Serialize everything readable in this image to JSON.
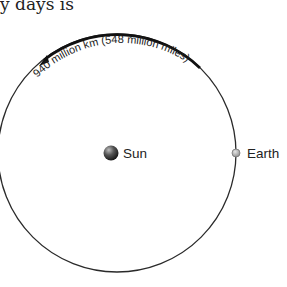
{
  "caption": "y days is",
  "diagram": {
    "distance_label": "940 million km (548 million miles)",
    "sun_label": "Sun",
    "earth_label": "Earth",
    "colors": {
      "orbit": "#2a2a2a",
      "arc": "#111111",
      "earth": "#9a9a9a",
      "sun": "#333333"
    }
  }
}
